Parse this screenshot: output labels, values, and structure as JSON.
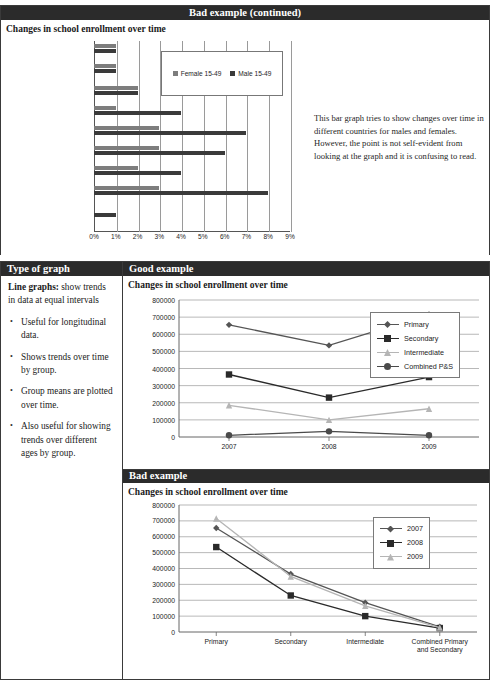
{
  "top_section": {
    "band_title": "Bad example (continued)",
    "chart_title": "Changes in school enrollment over time",
    "note": "This bar graph tries to show changes over time in different countries for males and females.  However, the point is not self-evident from looking at the graph and it is confusing to read."
  },
  "table": {
    "header_left": "Type of graph",
    "header_right_good": "Good example",
    "header_right_bad": "Bad example",
    "left_lead_bold": "Line graphs:",
    "left_lead_rest": " show trends in data at equal intervals",
    "left_bullets": [
      "Useful for longitudinal data.",
      "Shows trends over time by group.",
      "Group means are plotted over time.",
      "Also useful for showing trends over different ages by group."
    ],
    "good_chart_title": "Changes in school enrollment over time",
    "bad_chart_title": "Changes in school enrollment over time"
  },
  "colors": {
    "band_bg": "#2b2b2b",
    "band_text": "#ffffff",
    "female_bar": "#7d7d7d",
    "male_bar": "#3a3a3a",
    "primary_series": "#555555",
    "secondary_series": "#2a2a2a",
    "intermediate_series": "#b5b5b5",
    "combined_series": "#4a4a4a",
    "grid": "#9a9a9a"
  },
  "chart_data": [
    {
      "type": "bar",
      "title": "Changes in school enrollment over time",
      "orientation": "horizontal",
      "xlabel": "",
      "ylabel": "",
      "xlim": [
        0,
        9
      ],
      "xtick_labels": [
        "0%",
        "1%",
        "2%",
        "3%",
        "4%",
        "5%",
        "6%",
        "7%",
        "8%",
        "9%"
      ],
      "xticks": [
        0,
        1,
        2,
        3,
        4,
        5,
        6,
        7,
        8,
        9
      ],
      "grid": true,
      "legend": [
        "Female 15-49",
        "Male 15-49"
      ],
      "legend_position": "inside-top-right",
      "categories": [
        "Roina 2005",
        "Roina 2000",
        "Moavia 2003",
        "Moavia 1997",
        "Bronzalia State 2005",
        "Bronzalia State 1995",
        "Silverstar State 2003",
        "Silverstar State 1998",
        "Goldstar State 2006",
        "Goldstar State 2000"
      ],
      "series": [
        {
          "name": "Female 15-49",
          "values": [
            1,
            1,
            2,
            1,
            3,
            3,
            2,
            3,
            0,
            0
          ]
        },
        {
          "name": "Male 15-49",
          "values": [
            1,
            1,
            2,
            4,
            7,
            6,
            4,
            8,
            1,
            0
          ]
        }
      ]
    },
    {
      "type": "line",
      "title": "Changes in school enrollment over time",
      "panel": "Good example",
      "xlabel": "",
      "ylabel": "",
      "categories": [
        "2007",
        "2008",
        "2009"
      ],
      "ylim": [
        0,
        800000
      ],
      "yticks": [
        0,
        100000,
        200000,
        300000,
        400000,
        500000,
        600000,
        700000,
        800000
      ],
      "ytick_labels": [
        "0",
        "100000",
        "200000",
        "300000",
        "400000",
        "500000",
        "600000",
        "700000",
        "800000"
      ],
      "grid": true,
      "legend": [
        "Primary",
        "Secondary",
        "Intermediate",
        "Combined P&S"
      ],
      "legend_position": "right",
      "series": [
        {
          "name": "Primary",
          "values": [
            655000,
            535000,
            715000
          ],
          "marker": "diamond"
        },
        {
          "name": "Secondary",
          "values": [
            365000,
            230000,
            350000
          ],
          "marker": "square"
        },
        {
          "name": "Intermediate",
          "values": [
            185000,
            100000,
            165000
          ],
          "marker": "triangle"
        },
        {
          "name": "Combined P&S",
          "values": [
            10000,
            33000,
            10000
          ],
          "marker": "circle"
        }
      ]
    },
    {
      "type": "line",
      "title": "Changes in school enrollment over time",
      "panel": "Bad example",
      "xlabel": "",
      "ylabel": "",
      "categories": [
        "Primary",
        "Secondary",
        "Intermediate",
        "Combined Primary and Secondary"
      ],
      "ylim": [
        0,
        800000
      ],
      "yticks": [
        0,
        100000,
        200000,
        300000,
        400000,
        500000,
        600000,
        700000,
        800000
      ],
      "ytick_labels": [
        "0",
        "100000",
        "200000",
        "300000",
        "400000",
        "500000",
        "600000",
        "700000",
        "800000"
      ],
      "grid": true,
      "legend": [
        "2007",
        "2008",
        "2009"
      ],
      "legend_position": "inside-top-right",
      "series": [
        {
          "name": "2007",
          "values": [
            655000,
            365000,
            185000,
            33000
          ],
          "marker": "diamond"
        },
        {
          "name": "2008",
          "values": [
            535000,
            230000,
            100000,
            25000
          ],
          "marker": "square"
        },
        {
          "name": "2009",
          "values": [
            715000,
            350000,
            165000,
            28000
          ],
          "marker": "triangle"
        }
      ]
    }
  ]
}
